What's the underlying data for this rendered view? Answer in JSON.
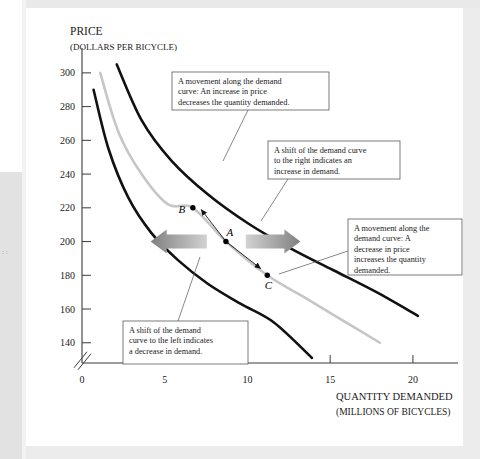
{
  "figure": {
    "background_color": "#ffffff",
    "page_color": "#e9e9e9"
  },
  "chart_data": {
    "type": "line",
    "title": "",
    "xlabel": "QUANTITY DEMANDED",
    "xlabel_sub": "(MILLIONS OF BICYCLES)",
    "ylabel": "PRICE",
    "ylabel_sub": "(DOLLARS PER BICYCLE)",
    "xlim": [
      0,
      22
    ],
    "ylim": [
      128,
      310
    ],
    "xticks": [
      0,
      5,
      10,
      15,
      20
    ],
    "yticks": [
      140,
      160,
      180,
      200,
      220,
      240,
      260,
      280,
      300
    ],
    "grid": false,
    "legend": "none",
    "y_axis_break": true,
    "series": [
      {
        "name": "D3 (decreased demand, left curve)",
        "color": "#111111",
        "style": "solid",
        "width": 2.6,
        "points": [
          [
            0.7,
            290
          ],
          [
            1.6,
            255
          ],
          [
            2.8,
            226
          ],
          [
            4.2,
            205
          ],
          [
            5.8,
            189
          ],
          [
            7.6,
            175
          ],
          [
            9.6,
            163
          ],
          [
            11.6,
            152
          ],
          [
            13.9,
            131
          ]
        ]
      },
      {
        "name": "D1 (original demand, middle curve)",
        "color": "#c6c6c6",
        "style": "solid",
        "width": 2.6,
        "points": [
          [
            1.1,
            300
          ],
          [
            2.2,
            265
          ],
          [
            3.6,
            240
          ],
          [
            5.2,
            222
          ],
          [
            6.7,
            220
          ],
          [
            8.7,
            200
          ],
          [
            11.2,
            180
          ],
          [
            13.6,
            166
          ],
          [
            15.8,
            153
          ],
          [
            18.0,
            140
          ]
        ]
      },
      {
        "name": "D2 (increased demand, right curve)",
        "color": "#111111",
        "style": "solid",
        "width": 2.6,
        "points": [
          [
            2.1,
            305
          ],
          [
            3.6,
            272
          ],
          [
            5.4,
            248
          ],
          [
            7.6,
            228
          ],
          [
            10.0,
            211
          ],
          [
            12.6,
            196
          ],
          [
            15.2,
            183
          ],
          [
            17.8,
            170
          ],
          [
            20.3,
            156
          ]
        ]
      }
    ],
    "points": [
      {
        "label": "B",
        "x": 6.7,
        "y": 220,
        "label_dx": -11,
        "label_dy": 5
      },
      {
        "label": "A",
        "x": 8.7,
        "y": 200,
        "label_dx": 4,
        "label_dy": -6
      },
      {
        "label": "C",
        "x": 11.2,
        "y": 180,
        "label_dx": 1,
        "label_dy": 14
      }
    ],
    "shift_arrows": [
      {
        "name": "shift-left-arrow",
        "direction": "left",
        "meaning": "decrease in demand"
      },
      {
        "name": "shift-right-arrow",
        "direction": "right",
        "meaning": "increase in demand"
      }
    ],
    "movement_arrows": [
      {
        "name": "movement-up-arrow",
        "from": [
          8.7,
          200
        ],
        "to": [
          7.2,
          219
        ],
        "meaning": "increase in price decreases quantity demanded"
      },
      {
        "name": "movement-down-arrow",
        "from": [
          8.7,
          200
        ],
        "to": [
          10.8,
          184
        ],
        "meaning": "decrease in price increases quantity demanded"
      }
    ],
    "annotations": [
      {
        "id": "callout-movement-up",
        "lines": [
          "A movement along the demand",
          "curve: An increase in price",
          "decreases the quantity demanded."
        ],
        "box": {
          "x": 146,
          "y": 64,
          "w": 157,
          "h": 38
        },
        "leader": [
          [
            222,
            102
          ],
          [
            197,
            153
          ]
        ]
      },
      {
        "id": "callout-shift-right",
        "lines": [
          "A shift of the demand curve",
          "to the right indicates an",
          "increase in demand."
        ],
        "box": {
          "x": 242,
          "y": 133,
          "w": 132,
          "h": 38
        },
        "leader": [
          [
            262,
            171
          ],
          [
            235,
            213
          ]
        ]
      },
      {
        "id": "callout-movement-down",
        "lines": [
          "A movement along the",
          "demand curve: A",
          "decrease in price",
          "increases the quantity",
          "demanded."
        ],
        "box": {
          "x": 322,
          "y": 211,
          "w": 114,
          "h": 56
        },
        "leader": [
          [
            322,
            243
          ],
          [
            253,
            266
          ]
        ]
      },
      {
        "id": "callout-shift-left",
        "lines": [
          "A shift of the demand",
          "curve to the left indicates",
          "a decrease in demand."
        ],
        "box": {
          "x": 97,
          "y": 313,
          "w": 125,
          "h": 43
        },
        "leader": [
          [
            152,
            313
          ],
          [
            174,
            249
          ]
        ]
      }
    ]
  }
}
